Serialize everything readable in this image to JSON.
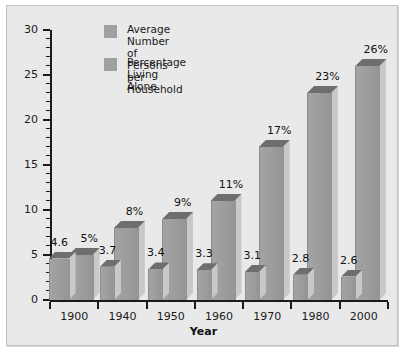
{
  "chart_data": {
    "type": "bar",
    "title": "",
    "xlabel": "Year",
    "ylabel": "",
    "ylim": [
      0,
      30
    ],
    "yticks": [
      0,
      5,
      10,
      15,
      20,
      25,
      30
    ],
    "ytick_labels": [
      "0",
      "5",
      "10",
      "15",
      "20",
      "25",
      "30"
    ],
    "minor_tick_step": 1,
    "grid": false,
    "legend_position": "top-left inside plot",
    "categories": [
      "1900",
      "1940",
      "1950",
      "1960",
      "1970",
      "1980",
      "2000"
    ],
    "series": [
      {
        "name": "Average Number of Persons per Household",
        "legend_label": "Average Number of\nPersons per Household",
        "values": [
          4.6,
          3.7,
          3.4,
          3.3,
          3.1,
          2.8,
          2.6
        ],
        "data_labels": [
          "4.6",
          "3.7",
          "3.4",
          "3.3",
          "3.1",
          "2.8",
          "2.6"
        ],
        "color": "#9c9c9c"
      },
      {
        "name": "Percentage Living Alone",
        "legend_label": "Percentage Living\nAlone",
        "values": [
          5,
          8,
          9,
          11,
          17,
          23,
          26
        ],
        "data_labels": [
          "5%",
          "8%",
          "9%",
          "11%",
          "17%",
          "23%",
          "26%"
        ],
        "color": "#9c9c9c"
      }
    ]
  },
  "legend": {
    "items": [
      {
        "label": "Average Number of\nPersons per Household",
        "swatch_color": "#a0a0a0"
      },
      {
        "label": "Percentage Living\nAlone",
        "swatch_color": "#a0a0a0"
      }
    ]
  },
  "axes": {
    "x_title": "Year",
    "x_tick_labels": [
      "1900",
      "1940",
      "1950",
      "1960",
      "1970",
      "1980",
      "2000"
    ],
    "y_tick_labels": [
      "30",
      "25",
      "20",
      "15",
      "10",
      "5",
      "0"
    ]
  },
  "colors": {
    "panel_background": "#e9e9e9",
    "panel_border": "#c2c2c2",
    "axis": "#1a1a1a",
    "bar_face": "#9c9c9c",
    "bar_top": "#6e6e6e",
    "bar_side": "#c9c9c9",
    "text": "#1a1a1a"
  }
}
